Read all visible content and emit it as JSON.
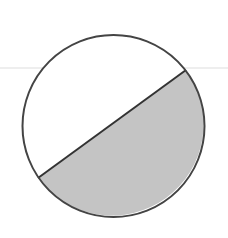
{
  "diagram": {
    "type": "circle-segment",
    "circle": {
      "cx": 113.5,
      "cy": 126,
      "r": 91,
      "stroke": "#444444",
      "stroke_width": 2,
      "fill": "#ffffff"
    },
    "chord": {
      "x1": 38,
      "y1": 178,
      "x2": 186,
      "y2": 70,
      "stroke": "#333333",
      "stroke_width": 2
    },
    "shaded_segment": {
      "fill": "#c4c4c4",
      "position": "below chord"
    },
    "guide_line": {
      "y": 68,
      "x1": 0,
      "x2": 228,
      "stroke": "#dddddd"
    }
  }
}
